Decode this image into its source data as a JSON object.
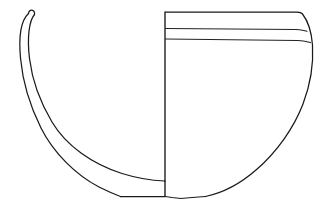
{
  "figure": {
    "drawing_type": "pottery-section-illustration",
    "caption": "",
    "background_color": "#ffffff",
    "ink_color": "#1a1a1a",
    "canvas": {
      "width": 328,
      "height": 213
    }
  },
  "vessel": {
    "name": "bowl",
    "convention": "left-half-section-right-half-exterior",
    "axis": {
      "label": "central-axis",
      "x": 165,
      "y_top": 12,
      "y_bottom": 196
    },
    "rim": {
      "label": "rim",
      "y": 12,
      "x_left": 165,
      "x_right": 302
    },
    "max_width_x": 313,
    "base": {
      "label": "flat-base",
      "y": 196,
      "x_left": 120,
      "x_right": 205
    },
    "handle": {
      "label": "strap-handle-profile",
      "tip_x": 28,
      "tip_y": 12
    }
  },
  "decoration": {
    "bands": [
      {
        "name": "upper-band-line",
        "y": 29
      },
      {
        "name": "lower-band-line",
        "y": 40
      }
    ],
    "band_count": 2
  },
  "section": {
    "left_profile": {
      "name": "vessel-wall-section",
      "outer_curve": "M 28 12 C 19 22 18 60 36 110 C 52 155 98 186 120 196",
      "inner_curve": "M 34 13 C 28 24 29 58 45 104 C 62 150 130 178 165 179"
    }
  },
  "exterior": {
    "right_profile": {
      "name": "vessel-exterior-contour",
      "path": "M 302 12 C 310 20 313 34 313 48 C 313 86 290 150 205 195"
    }
  },
  "labels": {
    "scale_text": "",
    "figure_number": ""
  }
}
